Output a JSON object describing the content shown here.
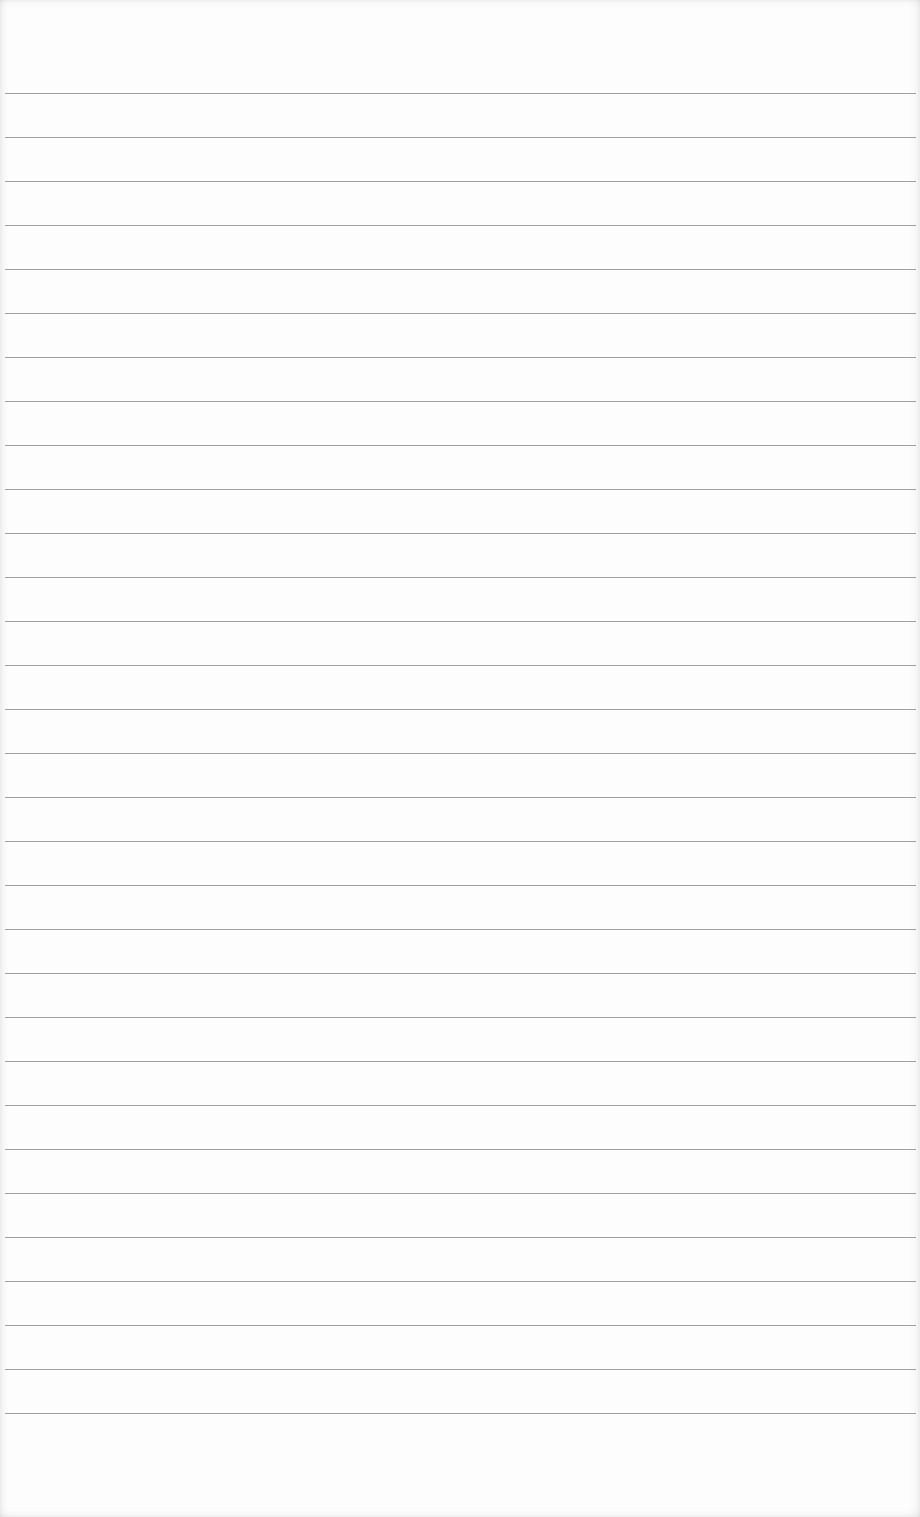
{
  "page": {
    "type": "lined-paper",
    "text_content": "",
    "line_count": 31,
    "first_line_y": 93,
    "line_spacing": 44,
    "line_left": 5,
    "line_width": 911
  },
  "colors": {
    "paper": "#fdfdfd",
    "rule_line": "#8f8f8f",
    "edge_shadow": "#e6e6e6"
  }
}
